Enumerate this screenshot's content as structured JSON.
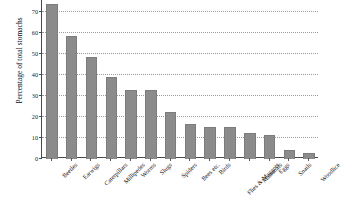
{
  "chart_data": {
    "type": "bar",
    "title": "",
    "subtitle": "",
    "xlabel": "",
    "ylabel": "Percentage of total stomachs",
    "ylim": [
      0,
      75
    ],
    "yticks": [
      0,
      10,
      20,
      30,
      40,
      50,
      60,
      70
    ],
    "ytick_labels": [
      "0",
      "10",
      "20",
      "30",
      "40",
      "50",
      "60",
      "70"
    ],
    "grid": true,
    "grid_axis": "y",
    "grid_style": "dotted",
    "legend": false,
    "legend_position": "none",
    "bar_color": "#8b8b8b",
    "categories": [
      "Beetles",
      "Earwigs",
      "Caterpillars",
      "Millipedes",
      "Worms",
      "Slugs",
      "Spiders",
      "Bees etc.",
      "Birds",
      "Flies & Maggots",
      "Mammals",
      "Eggs",
      "Snails",
      "Woodlice"
    ],
    "values": [
      73,
      58,
      48,
      38.5,
      32.5,
      32.5,
      22,
      16,
      14.5,
      14.5,
      12,
      11,
      4,
      2.5
    ]
  }
}
